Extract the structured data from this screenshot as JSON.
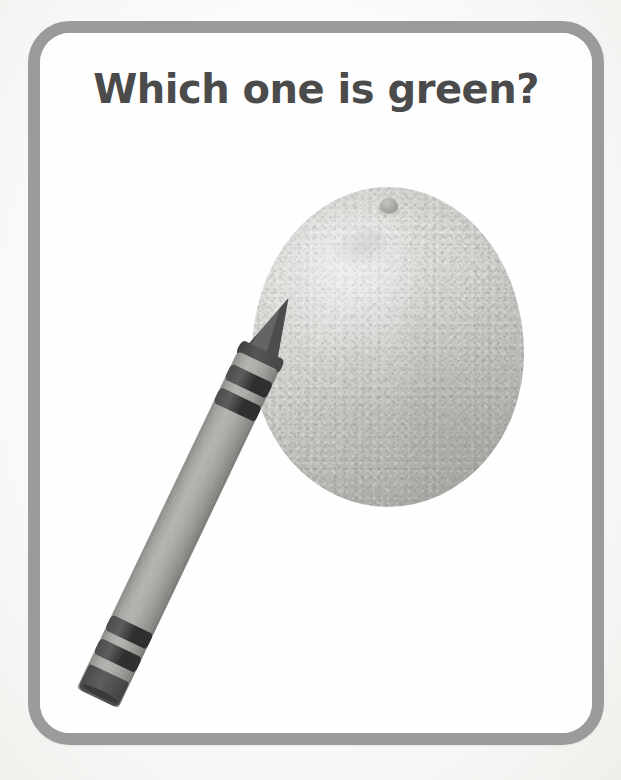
{
  "page": {
    "background_color": "#f7f6f4",
    "width": 621,
    "height": 780
  },
  "card": {
    "border_color": "#9b9b99",
    "background_color": "#ffffff",
    "corner_radius": "42px"
  },
  "question": {
    "text": "Which one is green?",
    "color": "#4b4b4b"
  },
  "choices": [
    {
      "name": "crayon",
      "label": "crayon",
      "is_answer": true,
      "body_color": "#a5a5a2",
      "tip_color": "#4d4d4d",
      "band_color": "#2f2f2f"
    },
    {
      "name": "orange",
      "label": "orange",
      "is_answer": false,
      "body_color": "#d6d6d3",
      "stem_color": "#a8a8a3"
    }
  ]
}
